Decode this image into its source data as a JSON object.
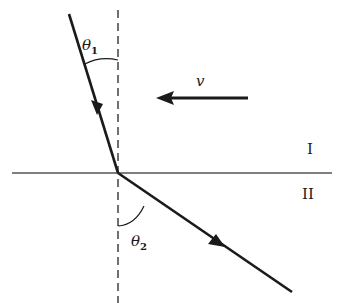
{
  "diagram": {
    "labels": {
      "theta1_symbol": "θ",
      "theta1_sub": "1",
      "theta2_symbol": "θ",
      "theta2_sub": "2",
      "velocity": "v",
      "region_upper": "I",
      "region_lower": "II"
    },
    "colors": {
      "ink": "#1a1a1a",
      "boundary": "#555555",
      "background": "#ffffff"
    }
  }
}
